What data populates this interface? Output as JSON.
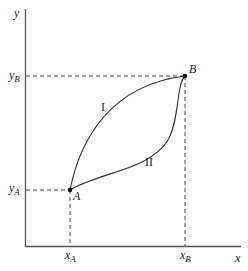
{
  "diagram": {
    "axes": {
      "x_label": "x",
      "y_label": "y"
    },
    "points": {
      "A": {
        "label": "A",
        "x_tick": "x",
        "x_tick_sub": "A",
        "y_tick": "y",
        "y_tick_sub": "A"
      },
      "B": {
        "label": "B",
        "x_tick": "x",
        "x_tick_sub": "B",
        "y_tick": "y",
        "y_tick_sub": "B"
      }
    },
    "paths": [
      {
        "id": "I",
        "label": "I"
      },
      {
        "id": "II",
        "label": "II"
      }
    ],
    "colors": {
      "line": "#333333",
      "dashed": "#444444",
      "background": "#ffffff"
    }
  }
}
